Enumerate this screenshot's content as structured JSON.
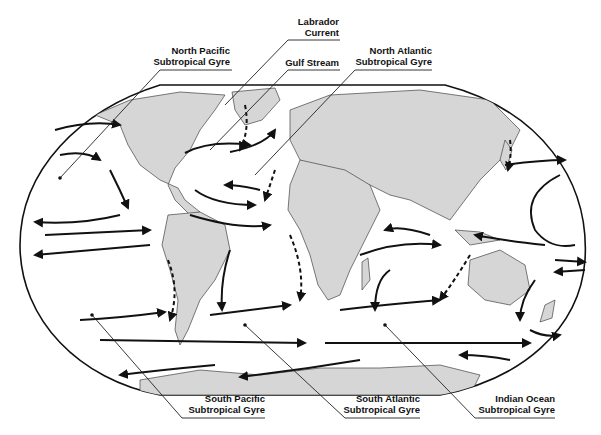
{
  "diagram": {
    "colors": {
      "land": "#d6d6d6",
      "ocean": "#ffffff",
      "outline": "#111111",
      "border": "#666666"
    },
    "labels": [
      {
        "id": "north_pacific",
        "line1": "North Pacific",
        "line2": "Subtropical Gyre"
      },
      {
        "id": "labrador",
        "line1": "Labrador",
        "line2": "Current"
      },
      {
        "id": "gulf_stream",
        "line1": "Gulf Stream",
        "line2": ""
      },
      {
        "id": "north_atlantic",
        "line1": "North Atlantic",
        "line2": "Subtropical Gyre"
      },
      {
        "id": "south_pacific",
        "line1": "South Pacific",
        "line2": "Subtropical Gyre"
      },
      {
        "id": "south_atlantic",
        "line1": "South Atlantic",
        "line2": "Subtropical Gyre"
      },
      {
        "id": "indian_ocean",
        "line1": "Indian Ocean",
        "line2": "Subtropical Gyre"
      }
    ]
  }
}
